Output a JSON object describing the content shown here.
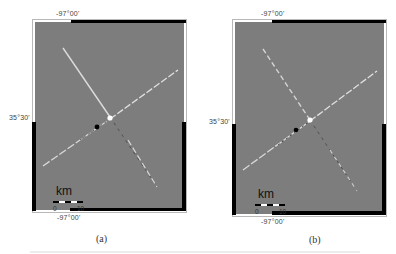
{
  "panels": [
    {
      "id": "a",
      "caption": "(a)",
      "top_lon_label": "-97°00'",
      "bottom_lon_label": "-97°00'",
      "left_lat_label": "35°30'",
      "scale": {
        "unit": "km",
        "ticks": [
          "0",
          "10"
        ]
      },
      "markers": [
        {
          "type": "white-star",
          "description": "intersection point"
        },
        {
          "type": "black-star",
          "description": "epicenter"
        }
      ]
    },
    {
      "id": "b",
      "caption": "(b)",
      "top_lon_label": "-97°00'",
      "bottom_lon_label": "-97°00'",
      "left_lat_label": "35°30'",
      "scale": {
        "unit": "km",
        "ticks": [
          "0",
          "10"
        ]
      },
      "markers": [
        {
          "type": "white-star",
          "description": "intersection point"
        },
        {
          "type": "black-star",
          "description": "epicenter"
        }
      ]
    }
  ],
  "colors": {
    "map_background": "#7d7d7d",
    "frame_black": "#000000",
    "lineament_light": "#e6e6e6",
    "lineament_dark": "#333333"
  }
}
